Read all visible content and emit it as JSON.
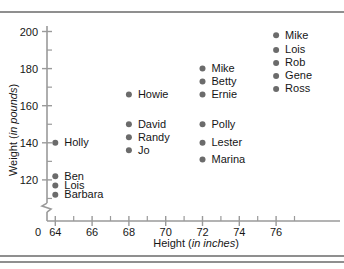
{
  "chart_data": {
    "type": "scatter",
    "title": "",
    "xlabel": "Height (in inches)",
    "xlabel_plain": "Height",
    "xlabel_em": "in inches",
    "ylabel": "Weight (in pounds)",
    "ylabel_plain": "Weight",
    "ylabel_em": "in pounds",
    "xlim": [
      63,
      77.5
    ],
    "ylim": [
      106,
      203
    ],
    "grid": false,
    "legend": "none",
    "y_axis_break": true,
    "x_ticks_major": [
      64,
      66,
      68,
      70,
      72,
      74,
      76
    ],
    "x_ticks_minor": [
      65,
      67,
      69,
      71,
      73,
      75,
      77
    ],
    "x_origin_label": "0",
    "y_ticks_major": [
      120,
      140,
      160,
      180,
      200
    ],
    "y_ticks_minor": [
      110,
      130,
      150,
      170,
      190
    ],
    "points": [
      {
        "label": "Holly",
        "x": 64,
        "y": 140
      },
      {
        "label": "Ben",
        "x": 64,
        "y": 122
      },
      {
        "label": "Lois",
        "x": 64,
        "y": 117
      },
      {
        "label": "Barbara",
        "x": 64,
        "y": 112
      },
      {
        "label": "Howie",
        "x": 68,
        "y": 166
      },
      {
        "label": "David",
        "x": 68,
        "y": 150
      },
      {
        "label": "Randy",
        "x": 68,
        "y": 143
      },
      {
        "label": "Jo",
        "x": 68,
        "y": 136
      },
      {
        "label": "Mike",
        "x": 72,
        "y": 180
      },
      {
        "label": "Betty",
        "x": 72,
        "y": 173
      },
      {
        "label": "Ernie",
        "x": 72,
        "y": 166
      },
      {
        "label": "Polly",
        "x": 72,
        "y": 150
      },
      {
        "label": "Lester",
        "x": 72,
        "y": 140
      },
      {
        "label": "Marina",
        "x": 72,
        "y": 131
      },
      {
        "label": "Mike",
        "x": 76,
        "y": 198
      },
      {
        "label": "Lois",
        "x": 76,
        "y": 190
      },
      {
        "label": "Rob",
        "x": 76,
        "y": 183
      },
      {
        "label": "Gene",
        "x": 76,
        "y": 176
      },
      {
        "label": "Ross",
        "x": 76,
        "y": 169
      }
    ]
  },
  "colors": {
    "dot": "#6b6b6b",
    "axis": "#9a9a9a",
    "rule": "#8f8f8f",
    "text": "#161616"
  }
}
